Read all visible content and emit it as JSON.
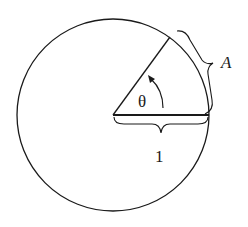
{
  "diagram": {
    "labels": {
      "arc": "A",
      "angle": "θ",
      "radius": "1"
    },
    "colors": {
      "stroke": "#1a1a1a",
      "background": "#ffffff"
    },
    "geometry": {
      "center": [
        113,
        115
      ],
      "radius": 96,
      "angle_degrees": 57
    }
  }
}
